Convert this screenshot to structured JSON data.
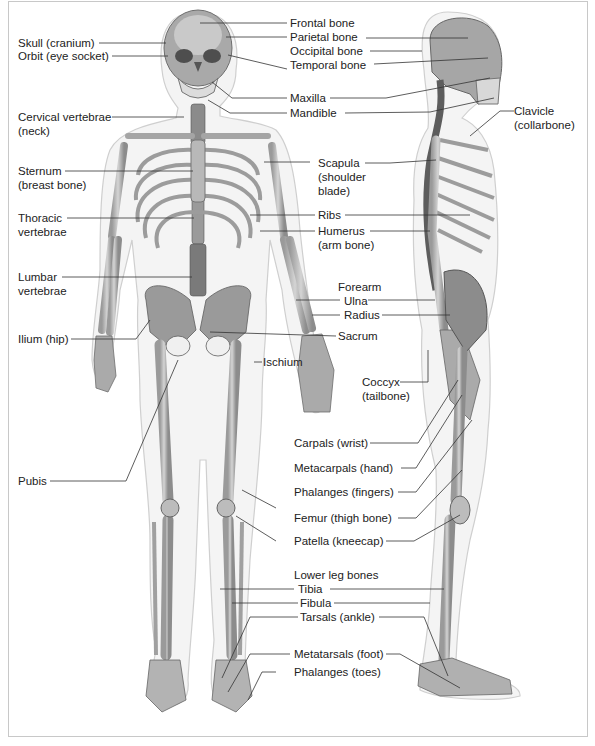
{
  "diagram": {
    "views": [
      "front",
      "side"
    ],
    "colors": {
      "bone": "#bdbdbd",
      "bone_dark": "#7a7a7a",
      "body_outline": "#e6e6e6",
      "leader": "#333333",
      "border": "#c8c8c8"
    }
  },
  "labels_left": [
    {
      "text": "Skull (cranium)"
    },
    {
      "text": "Orbit (eye socket)"
    },
    {
      "line1": "Cervical vertebrae",
      "line2": "(neck)"
    },
    {
      "line1": "Sternum",
      "line2": "(breast bone)"
    },
    {
      "line1": "Thoracic",
      "line2": "vertebrae"
    },
    {
      "line1": "Lumbar",
      "line2": "vertebrae"
    },
    {
      "text": "Ilium (hip)"
    },
    {
      "text": "Pubis"
    }
  ],
  "labels_center": [
    {
      "text": "Frontal bone"
    },
    {
      "text": "Parietal bone"
    },
    {
      "text": "Occipital bone"
    },
    {
      "text": "Temporal bone"
    },
    {
      "text": "Maxilla"
    },
    {
      "text": "Mandible"
    },
    {
      "line1": "Scapula",
      "line2": "(shoulder",
      "line3": "blade)"
    },
    {
      "text": "Ribs"
    },
    {
      "line1": "Humerus",
      "line2": "(arm bone)"
    },
    {
      "text": "Forearm"
    },
    {
      "text": "Ulna"
    },
    {
      "text": "Radius"
    },
    {
      "text": "Sacrum"
    },
    {
      "text": "Ischium"
    },
    {
      "line1": "Coccyx",
      "line2": "(tailbone)"
    },
    {
      "text": "Carpals (wrist)"
    },
    {
      "text": "Metacarpals (hand)"
    },
    {
      "text": "Phalanges (fingers)"
    },
    {
      "text": "Femur (thigh bone)"
    },
    {
      "text": "Patella (kneecap)"
    },
    {
      "text": "Lower leg bones"
    },
    {
      "text": "Tibia"
    },
    {
      "text": "Fibula"
    },
    {
      "text": "Tarsals (ankle)"
    },
    {
      "text": "Metatarsals (foot)"
    },
    {
      "text": "Phalanges (toes)"
    }
  ],
  "labels_right": [
    {
      "line1": "Clavicle",
      "line2": "(collarbone)"
    }
  ]
}
